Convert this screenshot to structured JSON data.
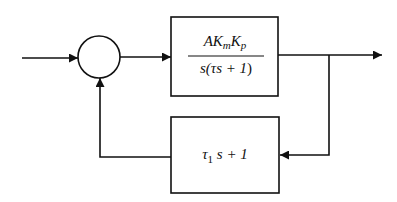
{
  "diagram": {
    "type": "block-diagram",
    "summing_junction": {
      "shape": "circle",
      "signs": []
    },
    "forward_block": {
      "numerator": {
        "A": "A",
        "K1": "K",
        "K1_sub": "m",
        "K2": "K",
        "K2_sub": "p"
      },
      "denominator": {
        "pre": "s(",
        "tau": "τ",
        "mid": "s + 1",
        "post": ")"
      }
    },
    "feedback_block": {
      "tau": "τ",
      "tau_sub": "1",
      "rest": " s + 1"
    },
    "colors": {
      "stroke": "#111111",
      "background": "#ffffff"
    }
  }
}
